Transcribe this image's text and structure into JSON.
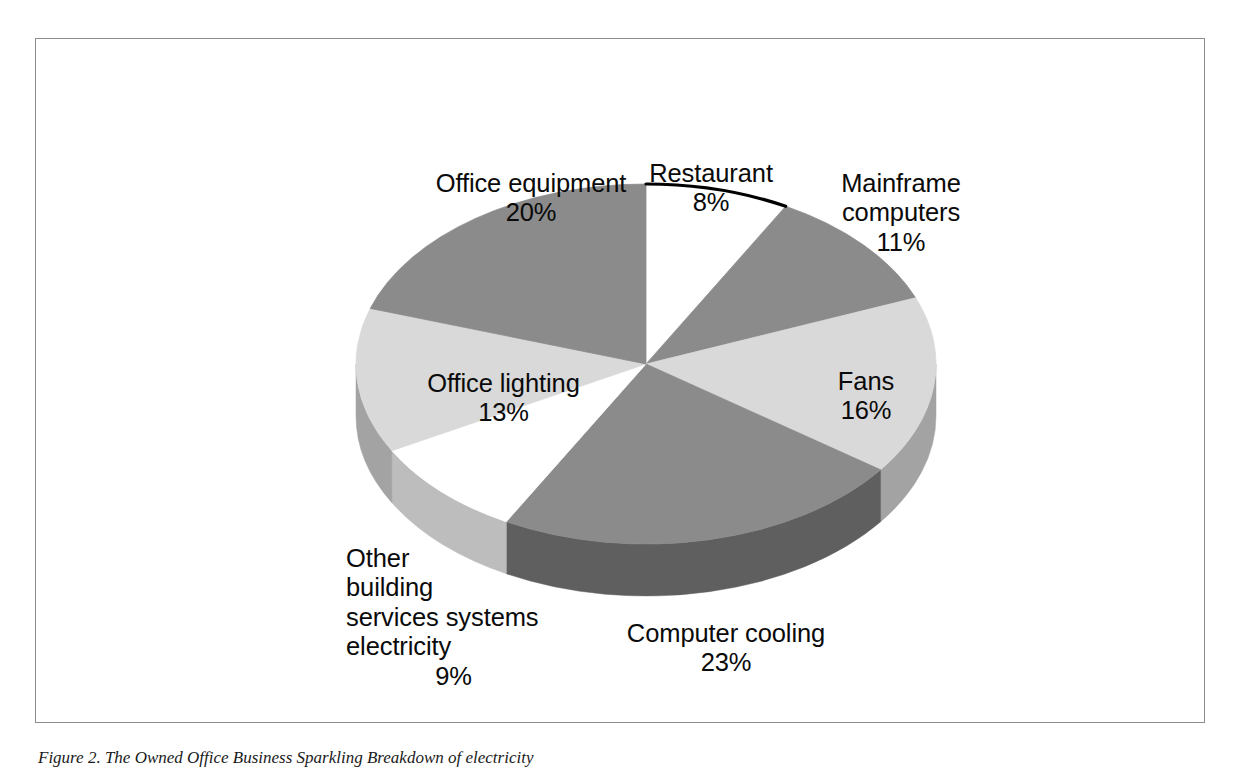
{
  "figure": {
    "caption": "Figure 2. The Owned Office Business Sparkling Breakdown of electricity",
    "frame_border_color": "#8c8c8c"
  },
  "chart_data": {
    "type": "pie",
    "title": "",
    "subtitle": "",
    "xlabel": "",
    "ylabel": "",
    "legend_position": "none",
    "grid": false,
    "units": "percent",
    "three_d": true,
    "start_angle_deg": 0,
    "direction": "clockwise",
    "categories": [
      "Restaurant",
      "Mainframe computers",
      "Fans",
      "Computer cooling",
      "Other building services systems electricity",
      "Office lighting",
      "Office equipment"
    ],
    "values": [
      8,
      11,
      16,
      23,
      9,
      13,
      20
    ],
    "slice_colors": [
      "#ffffff",
      "#8b8b8b",
      "#d9d9d9",
      "#8b8b8b",
      "#ffffff",
      "#d9d9d9",
      "#8b8b8b"
    ],
    "side_colors": [
      "#bdbdbd",
      "#5f5f5f",
      "#a3a3a3",
      "#5f5f5f",
      "#bdbdbd",
      "#a3a3a3",
      "#5f5f5f"
    ],
    "slices": [
      {
        "label": "Restaurant",
        "value": 8,
        "display": "8%",
        "color": "#ffffff",
        "side": "#bdbdbd"
      },
      {
        "label": "Mainframe computers",
        "value": 11,
        "display": "11%",
        "color": "#8b8b8b",
        "side": "#5f5f5f"
      },
      {
        "label": "Fans",
        "value": 16,
        "display": "16%",
        "color": "#d9d9d9",
        "side": "#a3a3a3"
      },
      {
        "label": "Computer cooling",
        "value": 23,
        "display": "23%",
        "color": "#8b8b8b",
        "side": "#5f5f5f"
      },
      {
        "label": "Other building services systems electricity",
        "value": 9,
        "display": "9%",
        "color": "#ffffff",
        "side": "#bdbdbd"
      },
      {
        "label": "Office lighting",
        "value": 13,
        "display": "13%",
        "color": "#d9d9d9",
        "side": "#a3a3a3"
      },
      {
        "label": "Office equipment",
        "value": 20,
        "display": "20%",
        "color": "#8b8b8b",
        "side": "#5f5f5f"
      }
    ]
  },
  "labels": {
    "office_equipment": {
      "name": "Office equipment",
      "pct": "20%"
    },
    "restaurant": {
      "name": "Restaurant",
      "pct": "8%"
    },
    "mainframe": {
      "name": "Mainframe\ncomputers",
      "pct": "11%"
    },
    "fans": {
      "name": "Fans",
      "pct": "16%"
    },
    "computer_cooling": {
      "name": "Computer cooling",
      "pct": "23%"
    },
    "other_building": {
      "name": "Other\nbuilding\nservices systems\nelectricity",
      "pct": "9%"
    },
    "office_lighting": {
      "name": "Office lighting",
      "pct": "13%"
    }
  }
}
